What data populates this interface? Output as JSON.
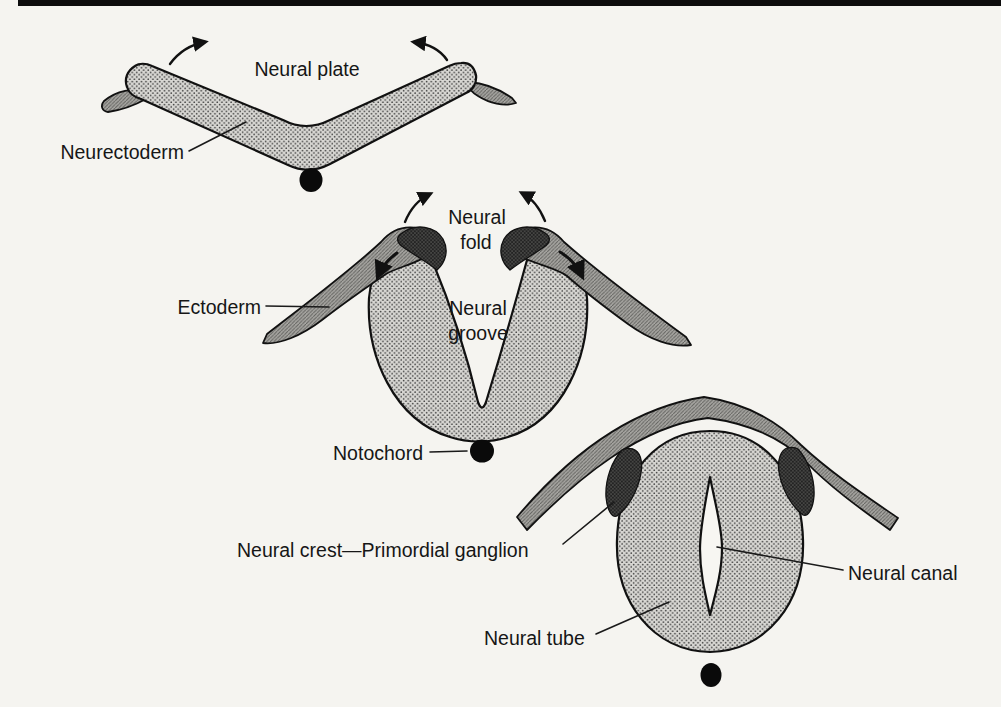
{
  "figure": {
    "type": "neurulation-cross-section-diagram",
    "labels": {
      "neural_plate": "Neural plate",
      "neurectoderm": "Neurectoderm",
      "neural_fold_line1": "Neural",
      "neural_fold_line2": "fold",
      "neural_groove_line1": "Neural",
      "neural_groove_line2": "groove",
      "ectoderm": "Ectoderm",
      "notochord": "Notochord",
      "neural_crest_primordial_ganglion": "Neural crest—Primordial ganglion",
      "neural_canal": "Neural canal",
      "neural_tube": "Neural tube"
    },
    "colors": {
      "background": "#f5f4f0",
      "top_rule": "#0d0d0d",
      "outline": "#111111",
      "label_text": "#161616",
      "stipple_fill_base": "#d8d7d3",
      "stipple_dot": "#3f3f3f",
      "ectoderm_base": "#a7a6a2",
      "ectoderm_hatch": "#5f5f5c",
      "crest_base": "#454543",
      "crest_dot": "#121212",
      "notochord_dot": "#0a0a0a",
      "canal_interior": "#f7f6f2"
    }
  }
}
